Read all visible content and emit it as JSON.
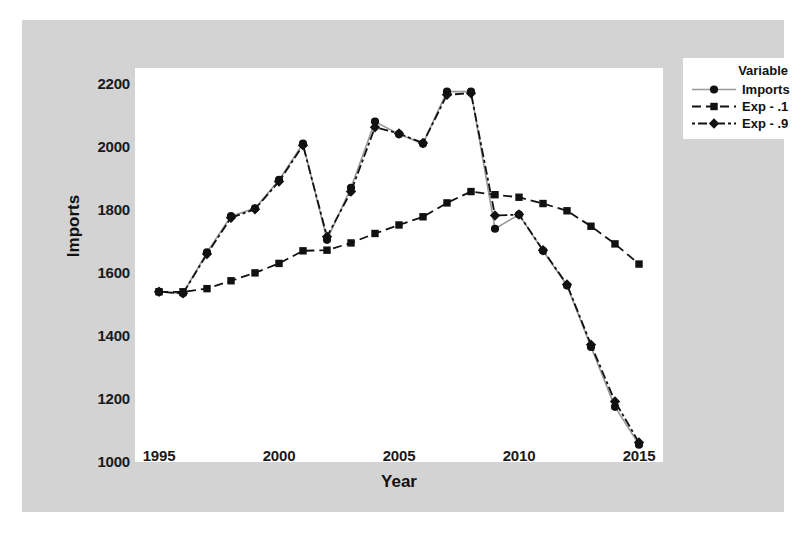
{
  "chart_data": {
    "type": "line",
    "title": "",
    "xlabel": "Year",
    "ylabel": "Imports",
    "xlim": [
      1994,
      2016
    ],
    "ylim": [
      1000,
      2250
    ],
    "grid": false,
    "legend_position": "top-right",
    "legend_title": "Variable",
    "x": [
      1995,
      1996,
      1997,
      1998,
      1999,
      2000,
      2001,
      2002,
      2003,
      2004,
      2005,
      2006,
      2007,
      2008,
      2009,
      2010,
      2011,
      2012,
      2013,
      2014,
      2015
    ],
    "xticks": [
      "1995",
      "2000",
      "2005",
      "2010",
      "2015"
    ],
    "xtick_values": [
      1995,
      2000,
      2005,
      2010,
      2015
    ],
    "yticks": [
      "1000",
      "1200",
      "1400",
      "1600",
      "1800",
      "2000",
      "2200"
    ],
    "ytick_values": [
      1000,
      1200,
      1400,
      1600,
      1800,
      2000,
      2200
    ],
    "series": [
      {
        "name": "Imports",
        "marker": "circle",
        "linestyle": "solid",
        "color": "#999999",
        "marker_color": "#111111",
        "values": [
          1540,
          1535,
          1665,
          1780,
          1805,
          1895,
          2010,
          1705,
          1870,
          2080,
          2040,
          2010,
          2175,
          2175,
          1740,
          1785,
          1670,
          1560,
          1365,
          1175,
          1055
        ]
      },
      {
        "name": "Exp - .1",
        "marker": "square",
        "linestyle": "dashed",
        "color": "#111111",
        "marker_color": "#111111",
        "values": [
          1540,
          1540,
          1550,
          1575,
          1600,
          1630,
          1670,
          1672,
          1695,
          1725,
          1752,
          1778,
          1822,
          1858,
          1848,
          1840,
          1820,
          1797,
          1748,
          1692,
          1628
        ]
      },
      {
        "name": "Exp - .9",
        "marker": "diamond",
        "linestyle": "dashdot",
        "color": "#111111",
        "marker_color": "#111111",
        "values": [
          1540,
          1535,
          1660,
          1775,
          1802,
          1890,
          2005,
          1715,
          1858,
          2062,
          2042,
          2012,
          2165,
          2170,
          1782,
          1785,
          1672,
          1563,
          1372,
          1192,
          1062
        ]
      }
    ]
  },
  "axes": {
    "x_title": "Year",
    "y_title": "Imports"
  },
  "legend": {
    "title": "Variable",
    "items": [
      {
        "label": "Imports",
        "key": "solid-circle-key"
      },
      {
        "label": "Exp - .1",
        "key": "dashed-square-key"
      },
      {
        "label": "Exp - .9",
        "key": "dashdot-diamond-key"
      }
    ]
  },
  "colors": {
    "figure_background": "#d3d3d3",
    "plot_background": "#ffffff",
    "series_line": "#111111",
    "imports_line": "#999999",
    "text": "#111111"
  }
}
